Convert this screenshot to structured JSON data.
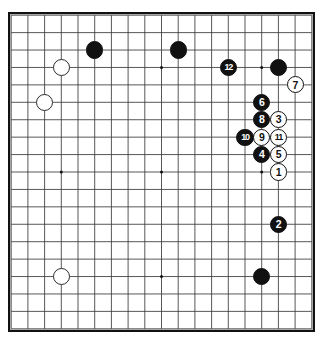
{
  "diagram": {
    "kind": "go-board-diagram",
    "board_size": 19,
    "colors": {
      "background": "#ffffff",
      "board": "#ffffff",
      "grid_line": "#3a3a3a",
      "border": "#111111",
      "black_stone": "#111111",
      "white_stone": "#ffffff",
      "stone_outline": "#111111",
      "black_label": "#ffffff",
      "white_label": "#111111"
    },
    "star_points": [
      {
        "col": 3,
        "row": 3
      },
      {
        "col": 9,
        "row": 3
      },
      {
        "col": 15,
        "row": 3
      },
      {
        "col": 3,
        "row": 9
      },
      {
        "col": 9,
        "row": 9
      },
      {
        "col": 15,
        "row": 9
      },
      {
        "col": 3,
        "row": 15
      },
      {
        "col": 9,
        "row": 15
      },
      {
        "col": 15,
        "row": 15
      }
    ],
    "stones": [
      {
        "id": "black-upper-left-approach",
        "color": "black",
        "label": "",
        "col": 5,
        "row": 2
      },
      {
        "id": "black-upper-center",
        "color": "black",
        "label": "",
        "col": 10,
        "row": 2
      },
      {
        "id": "white-upper-left-star",
        "color": "white",
        "label": "",
        "col": 3,
        "row": 3
      },
      {
        "id": "white-left-side",
        "color": "white",
        "label": "",
        "col": 2,
        "row": 5
      },
      {
        "id": "white-lower-left-star",
        "color": "white",
        "label": "",
        "col": 3,
        "row": 15
      },
      {
        "id": "black-upper-right-corner",
        "color": "black",
        "label": "",
        "col": 16,
        "row": 3
      },
      {
        "id": "black-lower-right-star",
        "color": "black",
        "label": "",
        "col": 15,
        "row": 15
      },
      {
        "id": "move-12",
        "color": "black",
        "label": "12",
        "col": 13,
        "row": 3
      },
      {
        "id": "move-7",
        "color": "white",
        "label": "7",
        "col": 17,
        "row": 4
      },
      {
        "id": "move-6",
        "color": "black",
        "label": "6",
        "col": 15,
        "row": 5
      },
      {
        "id": "move-8",
        "color": "black",
        "label": "8",
        "col": 15,
        "row": 6
      },
      {
        "id": "move-3",
        "color": "white",
        "label": "3",
        "col": 16,
        "row": 6
      },
      {
        "id": "move-10",
        "color": "black",
        "label": "10",
        "col": 14,
        "row": 7
      },
      {
        "id": "move-9",
        "color": "white",
        "label": "9",
        "col": 15,
        "row": 7
      },
      {
        "id": "move-11",
        "color": "white",
        "label": "11",
        "col": 16,
        "row": 7
      },
      {
        "id": "move-4",
        "color": "black",
        "label": "4",
        "col": 15,
        "row": 8
      },
      {
        "id": "move-5",
        "color": "white",
        "label": "5",
        "col": 16,
        "row": 8
      },
      {
        "id": "move-1",
        "color": "white",
        "label": "1",
        "col": 16,
        "row": 9
      },
      {
        "id": "move-2",
        "color": "black",
        "label": "2",
        "col": 16,
        "row": 12
      }
    ]
  }
}
